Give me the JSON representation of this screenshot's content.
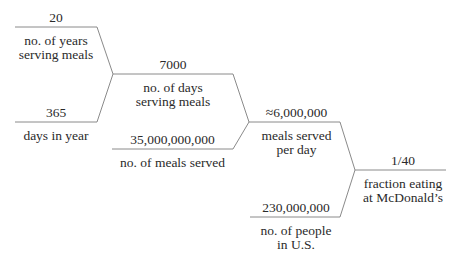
{
  "diagram": {
    "type": "estimation-tree",
    "line_color": "#8a8a8a",
    "text_color": "#2a2a2a",
    "nodes": [
      {
        "id": "years",
        "value": "20",
        "label_lines": [
          "no. of years",
          "serving meals"
        ]
      },
      {
        "id": "days_in_year",
        "value": "365",
        "label_lines": [
          "days in year"
        ]
      },
      {
        "id": "days_serving",
        "value": "7000",
        "label_lines": [
          "no. of days",
          "serving meals"
        ]
      },
      {
        "id": "meals_served",
        "value": "35,000,000,000",
        "label_lines": [
          "no. of meals served"
        ]
      },
      {
        "id": "meals_per_day",
        "value": "≈6,000,000",
        "label_lines": [
          "meals served",
          "per day"
        ]
      },
      {
        "id": "people_us",
        "value": "230,000,000",
        "label_lines": [
          "no. of people",
          "in U.S."
        ]
      },
      {
        "id": "fraction",
        "value": "1/40",
        "label_lines": [
          "fraction eating",
          "at McDonald’s"
        ]
      }
    ],
    "edges": [
      {
        "from": "years",
        "to": "days_serving"
      },
      {
        "from": "days_in_year",
        "to": "days_serving"
      },
      {
        "from": "days_serving",
        "to": "meals_per_day"
      },
      {
        "from": "meals_served",
        "to": "meals_per_day"
      },
      {
        "from": "meals_per_day",
        "to": "fraction"
      },
      {
        "from": "people_us",
        "to": "fraction"
      }
    ]
  }
}
